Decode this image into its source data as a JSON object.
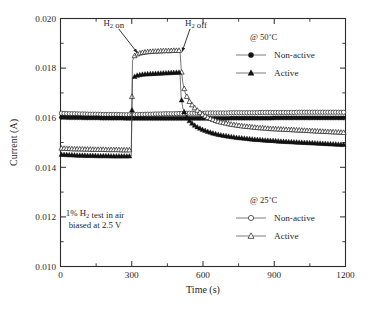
{
  "chart_data": {
    "type": "line",
    "title": "",
    "xlabel": "Time (s)",
    "ylabel": "Current (A)",
    "xlim": [
      0,
      1200
    ],
    "ylim": [
      0.01,
      0.02
    ],
    "xticks": [
      0,
      300,
      600,
      900,
      1200
    ],
    "xtick_labels": [
      "0",
      "300",
      "600",
      "900",
      "1200"
    ],
    "xminor_step": 150,
    "yticks": [
      0.01,
      0.012,
      0.014,
      0.016,
      0.018,
      0.02
    ],
    "ytick_labels": [
      "0.010",
      "0.012",
      "0.014",
      "0.016",
      "0.018",
      "0.020"
    ],
    "yminor_step": 0.001,
    "grid": false,
    "legend_position": "right",
    "annotations": [
      {
        "name": "h2-on",
        "text": "H2 on",
        "text_html": "H<sub>2</sub> on",
        "x": 300,
        "y": 0.0197
      },
      {
        "name": "h2-off",
        "text": "H2 off",
        "text_html": "H<sub>2</sub> off",
        "x": 520,
        "y": 0.0197
      },
      {
        "name": "test-conditions-line1",
        "text": "1% H2 test in air",
        "text_html": "1% H<sub>2</sub> test in air",
        "x": 120,
        "y": 0.01205
      },
      {
        "name": "test-conditions-line2",
        "text": "biased at 2.5 V",
        "text_html": "biased at 2.5 V",
        "x": 120,
        "y": 0.01155
      }
    ],
    "legend_groups": [
      {
        "name": "legend-50c",
        "header": "@ 50˚C",
        "entries": [
          {
            "label": "Non-active",
            "marker": "filled-circle",
            "series": "nonactive_50"
          },
          {
            "label": "Active",
            "marker": "filled-triangle",
            "series": "active_50"
          }
        ]
      },
      {
        "name": "legend-25c",
        "header": "@ 25˚C",
        "entries": [
          {
            "label": "Non-active",
            "marker": "open-circle",
            "series": "nonactive_25"
          },
          {
            "label": "Active",
            "marker": "open-triangle",
            "series": "active_25"
          }
        ]
      }
    ],
    "series": [
      {
        "name": "nonactive_25",
        "label": "Non-active",
        "temperature": "25˚C",
        "marker": "open-circle",
        "x": [
          0,
          20,
          40,
          60,
          80,
          100,
          120,
          140,
          160,
          180,
          200,
          220,
          240,
          260,
          280,
          300,
          305,
          320,
          340,
          360,
          380,
          400,
          420,
          440,
          460,
          480,
          500,
          505,
          520,
          540,
          560,
          580,
          600,
          620,
          640,
          660,
          680,
          700,
          720,
          740,
          760,
          780,
          800,
          820,
          840,
          860,
          880,
          900,
          920,
          940,
          960,
          980,
          1000,
          1020,
          1040,
          1060,
          1080,
          1100,
          1120,
          1140,
          1160,
          1180,
          1200
        ],
        "y": [
          0.01618,
          0.01617,
          0.01616,
          0.01616,
          0.01615,
          0.01615,
          0.01614,
          0.01614,
          0.01614,
          0.01613,
          0.01613,
          0.01613,
          0.01613,
          0.01612,
          0.01612,
          0.01612,
          0.01612,
          0.01613,
          0.01613,
          0.01614,
          0.01614,
          0.01615,
          0.01615,
          0.01616,
          0.01616,
          0.01616,
          0.01617,
          0.01617,
          0.01617,
          0.01618,
          0.01618,
          0.01618,
          0.01618,
          0.01619,
          0.01619,
          0.01619,
          0.01619,
          0.01619,
          0.0162,
          0.0162,
          0.0162,
          0.0162,
          0.0162,
          0.0162,
          0.01621,
          0.01621,
          0.01621,
          0.01621,
          0.01621,
          0.01621,
          0.01621,
          0.01621,
          0.01622,
          0.01622,
          0.01622,
          0.01622,
          0.01622,
          0.01622,
          0.01622,
          0.01622,
          0.01622,
          0.01622,
          0.01622
        ]
      },
      {
        "name": "nonactive_50",
        "label": "Non-active",
        "temperature": "50˚C",
        "marker": "filled-circle",
        "x": [
          0,
          20,
          40,
          60,
          80,
          100,
          120,
          140,
          160,
          180,
          200,
          220,
          240,
          260,
          280,
          300,
          305,
          320,
          340,
          360,
          380,
          400,
          420,
          440,
          460,
          480,
          500,
          505,
          520,
          540,
          560,
          580,
          600,
          620,
          640,
          660,
          680,
          700,
          720,
          740,
          760,
          780,
          800,
          820,
          840,
          860,
          880,
          900,
          920,
          940,
          960,
          980,
          1000,
          1020,
          1040,
          1060,
          1080,
          1100,
          1120,
          1140,
          1160,
          1180,
          1200
        ],
        "y": [
          0.01601,
          0.01601,
          0.016,
          0.016,
          0.016,
          0.01599,
          0.01599,
          0.01599,
          0.01599,
          0.01598,
          0.01598,
          0.01598,
          0.01598,
          0.01598,
          0.01597,
          0.01597,
          0.01597,
          0.01597,
          0.01597,
          0.01597,
          0.01597,
          0.01597,
          0.01597,
          0.01597,
          0.01597,
          0.01597,
          0.01597,
          0.01597,
          0.01597,
          0.01597,
          0.01597,
          0.01597,
          0.01597,
          0.01597,
          0.01597,
          0.01597,
          0.01597,
          0.01597,
          0.01598,
          0.01598,
          0.01598,
          0.01598,
          0.01598,
          0.01598,
          0.01598,
          0.01598,
          0.01598,
          0.01599,
          0.01599,
          0.01599,
          0.01599,
          0.01599,
          0.01599,
          0.01599,
          0.01599,
          0.01599,
          0.01599,
          0.01599,
          0.01599,
          0.01599,
          0.01599,
          0.01599,
          0.01599
        ]
      },
      {
        "name": "active_25",
        "label": "Active",
        "temperature": "25˚C",
        "marker": "open-triangle",
        "x": [
          0,
          20,
          40,
          60,
          80,
          100,
          120,
          140,
          160,
          180,
          200,
          220,
          240,
          260,
          280,
          298,
          303,
          310,
          320,
          340,
          360,
          380,
          400,
          420,
          440,
          460,
          480,
          500,
          503,
          508,
          515,
          525,
          540,
          560,
          580,
          600,
          620,
          640,
          660,
          680,
          700,
          720,
          740,
          760,
          780,
          800,
          820,
          840,
          860,
          880,
          900,
          920,
          940,
          960,
          980,
          1000,
          1020,
          1040,
          1060,
          1080,
          1100,
          1120,
          1140,
          1160,
          1180,
          1200
        ],
        "y": [
          0.01477,
          0.01476,
          0.01475,
          0.01474,
          0.01474,
          0.01473,
          0.01473,
          0.01472,
          0.01472,
          0.01472,
          0.01471,
          0.01471,
          0.01471,
          0.0147,
          0.0147,
          0.0147,
          0.01828,
          0.01848,
          0.01856,
          0.01862,
          0.01865,
          0.01867,
          0.01868,
          0.01869,
          0.0187,
          0.0187,
          0.01871,
          0.01871,
          0.01871,
          0.018,
          0.01742,
          0.017,
          0.01669,
          0.01644,
          0.01626,
          0.01612,
          0.01601,
          0.01593,
          0.01586,
          0.01581,
          0.01577,
          0.01573,
          0.0157,
          0.01567,
          0.01565,
          0.01563,
          0.01561,
          0.01559,
          0.01558,
          0.01556,
          0.01555,
          0.01554,
          0.01553,
          0.01552,
          0.01551,
          0.0155,
          0.01549,
          0.01548,
          0.01547,
          0.01546,
          0.01545,
          0.01544,
          0.01543,
          0.01542,
          0.01541,
          0.0154
        ]
      },
      {
        "name": "active_50",
        "label": "Active",
        "temperature": "50˚C",
        "marker": "filled-triangle",
        "x": [
          0,
          20,
          40,
          60,
          80,
          100,
          120,
          140,
          160,
          180,
          200,
          220,
          240,
          260,
          280,
          298,
          303,
          310,
          320,
          340,
          360,
          380,
          400,
          420,
          440,
          460,
          480,
          500,
          503,
          508,
          515,
          525,
          540,
          560,
          580,
          600,
          620,
          640,
          660,
          680,
          700,
          720,
          740,
          760,
          780,
          800,
          820,
          840,
          860,
          880,
          900,
          920,
          940,
          960,
          980,
          1000,
          1020,
          1040,
          1060,
          1080,
          1100,
          1120,
          1140,
          1160,
          1180,
          1200
        ],
        "y": [
          0.01452,
          0.01451,
          0.0145,
          0.01449,
          0.01448,
          0.01448,
          0.01447,
          0.01447,
          0.01446,
          0.01446,
          0.01446,
          0.01445,
          0.01445,
          0.01445,
          0.01445,
          0.01445,
          0.01755,
          0.01765,
          0.0177,
          0.01774,
          0.01776,
          0.01777,
          0.01778,
          0.01779,
          0.0178,
          0.01781,
          0.01782,
          0.01783,
          0.01783,
          0.01683,
          0.0164,
          0.01612,
          0.0159,
          0.01572,
          0.0156,
          0.01551,
          0.01544,
          0.01538,
          0.01533,
          0.01529,
          0.01526,
          0.01523,
          0.0152,
          0.01518,
          0.01516,
          0.01514,
          0.01512,
          0.01511,
          0.01509,
          0.01508,
          0.01507,
          0.01505,
          0.01504,
          0.01503,
          0.01502,
          0.01501,
          0.015,
          0.01499,
          0.01498,
          0.01497,
          0.01496,
          0.01495,
          0.01494,
          0.01493,
          0.01492,
          0.01491
        ]
      }
    ]
  },
  "figure": {
    "background_color": "#ffffff",
    "axis_color": "#2b2b2b",
    "marker_fill_color": "#111111",
    "marker_open_color": "#ffffff"
  }
}
